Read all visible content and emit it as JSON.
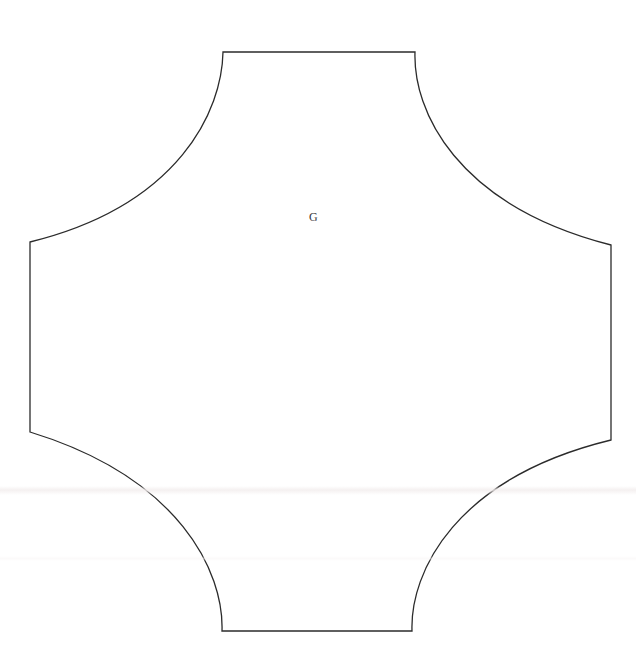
{
  "document": {
    "title": "Geometric Figure",
    "background_color": "#ffffff",
    "width": 636,
    "height": 668
  },
  "figure": {
    "name": "concave-square-cross",
    "stroke_color": "#2b2b2b",
    "stroke_width": 1.3,
    "fill": "none",
    "center": {
      "x": 320,
      "y": 341
    },
    "arm_half_span": 96,
    "corner_arc_radius": 193,
    "vertices": [
      {
        "id": "top-left",
        "x": 223,
        "y": 52
      },
      {
        "id": "top-right",
        "x": 415,
        "y": 52
      },
      {
        "id": "right-top",
        "x": 611,
        "y": 245
      },
      {
        "id": "right-bottom",
        "x": 611,
        "y": 440
      },
      {
        "id": "bottom-right",
        "x": 412,
        "y": 631
      },
      {
        "id": "bottom-left",
        "x": 222,
        "y": 631
      },
      {
        "id": "left-bottom",
        "x": 30,
        "y": 432
      },
      {
        "id": "left-top",
        "x": 30,
        "y": 242
      }
    ],
    "edges": [
      {
        "id": "top-arm-edge",
        "type": "bowed-line",
        "from": "top-left",
        "to": "top-right"
      },
      {
        "id": "arc-top-right",
        "type": "concave-arc",
        "from": "top-right",
        "to": "right-top"
      },
      {
        "id": "right-arm-edge",
        "type": "bowed-line",
        "from": "right-top",
        "to": "right-bottom"
      },
      {
        "id": "arc-bottom-right",
        "type": "concave-arc",
        "from": "right-bottom",
        "to": "bottom-right"
      },
      {
        "id": "bottom-arm-edge",
        "type": "bowed-line",
        "from": "bottom-right",
        "to": "bottom-left"
      },
      {
        "id": "arc-bottom-left",
        "type": "concave-arc",
        "from": "bottom-left",
        "to": "left-bottom"
      },
      {
        "id": "left-arm-edge",
        "type": "bowed-line",
        "from": "left-bottom",
        "to": "left-top"
      },
      {
        "id": "arc-top-left",
        "type": "concave-arc",
        "from": "left-top",
        "to": "top-left"
      }
    ],
    "path_d": "M 223 52 L 415 52 C 413 110 455 205 611 245 L 611 440 C 455 478 410 572 412 631 L 222 631 C 224 572 180 478 30 432 L 30 242 C 180 205 222 110 223 52 Z"
  },
  "labels": {
    "center_label": {
      "text": "G",
      "x": 313,
      "y": 219,
      "font_size": 12,
      "color": "#3a3a3a"
    }
  },
  "artifacts": {
    "scan_bands": [
      {
        "id": "scan-band-1",
        "y": 486,
        "height": 9
      },
      {
        "id": "scan-band-2",
        "y": 556,
        "height": 5
      }
    ]
  }
}
